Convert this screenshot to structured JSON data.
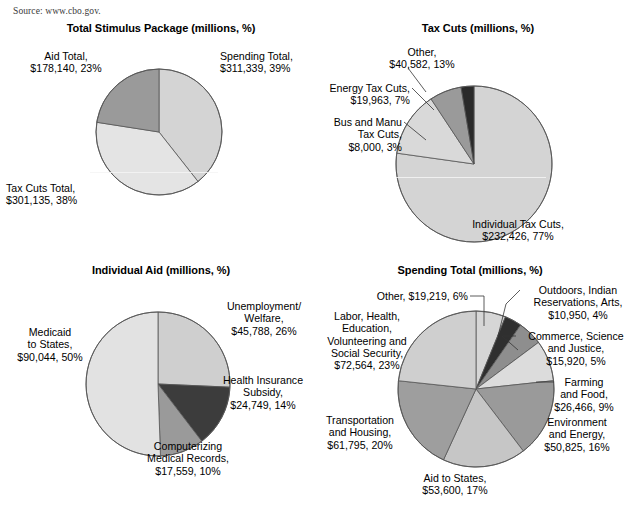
{
  "source": {
    "text": "Source: www.cbo.gov."
  },
  "palette": {
    "lightest": "#e4e4e4",
    "light": "#d4d4d4",
    "light_mid": "#cfcfcf",
    "mid": "#9a9a9a",
    "mid_dark": "#8e8e8e",
    "dark": "#3c3c3c",
    "darkest": "#2a2a2a",
    "outline": "#555555",
    "text": "#000000"
  },
  "charts": [
    {
      "id": "total-stimulus",
      "title": "Total Stimulus Package (millions, %)",
      "chart_data": {
        "type": "pie",
        "title": "Total Stimulus Package (millions, %)",
        "unit": "millions",
        "categories": [
          "Spending Total",
          "Tax Cuts Total",
          "Aid Total"
        ],
        "values": [
          311339,
          301135,
          178140
        ],
        "percents": [
          39,
          38,
          23
        ],
        "labels": [
          "Spending Total,\n$311,339, 39%",
          "Tax Cuts Total,\n$301,135, 38%",
          "Aid Total,\n$178,140, 23%"
        ],
        "colors": [
          "#d4d4d4",
          "#e4e4e4",
          "#9a9a9a"
        ],
        "legend": "none",
        "start_angle": 0
      }
    },
    {
      "id": "tax-cuts",
      "title": "Tax Cuts (millions, %)",
      "chart_data": {
        "type": "pie",
        "title": "Tax Cuts (millions, %)",
        "unit": "millions",
        "categories": [
          "Individual Tax Cuts",
          "Other",
          "Energy Tax Cuts",
          "Bus and Manu Tax Cuts"
        ],
        "values": [
          232426,
          40582,
          19963,
          8000
        ],
        "percents": [
          77,
          13,
          7,
          3
        ],
        "labels": [
          "Individual Tax Cuts,\n$232,426, 77%",
          "Other,\n$40,582, 13%",
          "Energy Tax Cuts,\n$19,963, 7%",
          "Bus and Manu\nTax Cuts,\n$8,000, 3%"
        ],
        "colors": [
          "#d4d4d4",
          "#d9d9d9",
          "#9a9a9a",
          "#2a2a2a"
        ],
        "legend": "none",
        "start_angle": 0
      }
    },
    {
      "id": "individual-aid",
      "title": "Individual Aid (millions, %)",
      "chart_data": {
        "type": "pie",
        "title": "Individual Aid (millions, %)",
        "unit": "millions",
        "categories": [
          "Unemployment/Welfare",
          "Health Insurance Subsidy",
          "Computerizing Medical Records",
          "Medicaid to States"
        ],
        "values": [
          45788,
          24749,
          17559,
          90044
        ],
        "percents": [
          26,
          14,
          10,
          50
        ],
        "labels": [
          "Unemployment/\nWelfare,\n$45,788, 26%",
          "Health Insurance\nSubsidy,\n$24,749, 14%",
          "Computerizing\nMedical Records,\n$17,559, 10%",
          "Medicaid\nto States,\n$90,044, 50%"
        ],
        "colors": [
          "#cfcfcf",
          "#3c3c3c",
          "#9a9a9a",
          "#e2e2e2"
        ],
        "legend": "none",
        "start_angle": 0
      }
    },
    {
      "id": "spending-total",
      "title": "Spending Total (millions, %)",
      "chart_data": {
        "type": "pie",
        "title": "Spending Total (millions, %)",
        "unit": "millions",
        "categories": [
          "Other",
          "Outdoors, Indian Reservations, Arts",
          "Commerce, Science and Justice",
          "Farming and Food",
          "Environment and Energy",
          "Aid to States",
          "Transportation and Housing",
          "Labor, Health, Education, Volunteering and Social Security"
        ],
        "values": [
          19219,
          10950,
          15920,
          26466,
          50825,
          53600,
          61795,
          72564
        ],
        "percents": [
          6,
          4,
          5,
          9,
          16,
          17,
          20,
          23
        ],
        "labels": [
          "Other, $19,219, 6%",
          "Outdoors, Indian\nReservations, Arts,\n$10,950, 4%",
          "Commerce, Science\nand Justice,\n$15,920, 5%",
          "Farming\nand Food,\n$26,466, 9%",
          "Environment\nand Energy,\n$50,825, 16%",
          "Aid to States,\n$53,600, 17%",
          "Transportation\nand Housing,\n$61,795, 20%",
          "Labor, Health,\nEducation,\nVolunteering and\nSocial Security,\n$72,564, 23%"
        ],
        "colors": [
          "#d6d6d6",
          "#2f2f2f",
          "#8e8e8e",
          "#dcdcdc",
          "#9a9a9a",
          "#c6c6c6",
          "#9e9e9e",
          "#cfcfcf"
        ],
        "legend": "none",
        "start_angle": 0
      }
    }
  ],
  "layout": {
    "pies": [
      {
        "cx": 153,
        "cy": 110,
        "r": 63
      },
      {
        "cx": 152,
        "cy": 142,
        "r": 78
      },
      {
        "cx": 152,
        "cy": 120,
        "r": 72
      },
      {
        "cx": 170,
        "cy": 125,
        "r": 78
      }
    ],
    "labels": [
      [
        {
          "x": 214,
          "y": 28,
          "w": 96,
          "align": "left"
        },
        {
          "x": 0,
          "y": 160,
          "w": 96,
          "align": "left"
        },
        {
          "x": 12,
          "y": 28,
          "w": 96,
          "align": "center"
        }
      ],
      [
        {
          "x": 126,
          "y": 196,
          "w": 140,
          "align": "center"
        },
        {
          "x": 48,
          "y": 24,
          "w": 104,
          "align": "center"
        },
        {
          "x": 0,
          "y": 60,
          "w": 88,
          "align": "right"
        },
        {
          "x": 0,
          "y": 94,
          "w": 80,
          "align": "right"
        }
      ],
      [
        {
          "x": 206,
          "y": 36,
          "w": 104,
          "align": "center"
        },
        {
          "x": 204,
          "y": 110,
          "w": 106,
          "align": "center"
        },
        {
          "x": 120,
          "y": 176,
          "w": 124,
          "align": "center"
        },
        {
          "x": 0,
          "y": 62,
          "w": 88,
          "align": "center"
        }
      ],
      [
        {
          "x": 12,
          "y": 26,
          "w": 150,
          "align": "right"
        },
        {
          "x": 216,
          "y": 20,
          "w": 112,
          "align": "center"
        },
        {
          "x": 212,
          "y": 66,
          "w": 116,
          "align": "center"
        },
        {
          "x": 232,
          "y": 112,
          "w": 92,
          "align": "center"
        },
        {
          "x": 220,
          "y": 152,
          "w": 102,
          "align": "center"
        },
        {
          "x": 94,
          "y": 208,
          "w": 110,
          "align": "center"
        },
        {
          "x": 0,
          "y": 150,
          "w": 108,
          "align": "center"
        },
        {
          "x": 0,
          "y": 46,
          "w": 122,
          "align": "center"
        }
      ]
    ],
    "leaders": [
      [],
      [
        [],
        [
          {
            "x1": 86,
            "y1": 46,
            "x2": 104,
            "y2": 70
          }
        ],
        [
          {
            "x1": 90,
            "y1": 66,
            "x2": 112,
            "y2": 88
          }
        ],
        [
          {
            "x1": 82,
            "y1": 100,
            "x2": 104,
            "y2": 118
          }
        ]
      ],
      [],
      [
        [
          {
            "x1": 164,
            "y1": 32,
            "x2": 178,
            "y2": 32
          },
          {
            "x1": 178,
            "y1": 32,
            "x2": 178,
            "y2": 62
          }
        ],
        [
          {
            "x1": 214,
            "y1": 26,
            "x2": 200,
            "y2": 40
          },
          {
            "x1": 200,
            "y1": 40,
            "x2": 192,
            "y2": 72
          }
        ],
        [
          {
            "x1": 210,
            "y1": 72,
            "x2": 196,
            "y2": 72
          },
          {
            "x1": 196,
            "y1": 72,
            "x2": 212,
            "y2": 86
          }
        ],
        [
          {
            "x1": 230,
            "y1": 118,
            "x2": 248,
            "y2": 118
          }
        ]
      ]
    ]
  }
}
